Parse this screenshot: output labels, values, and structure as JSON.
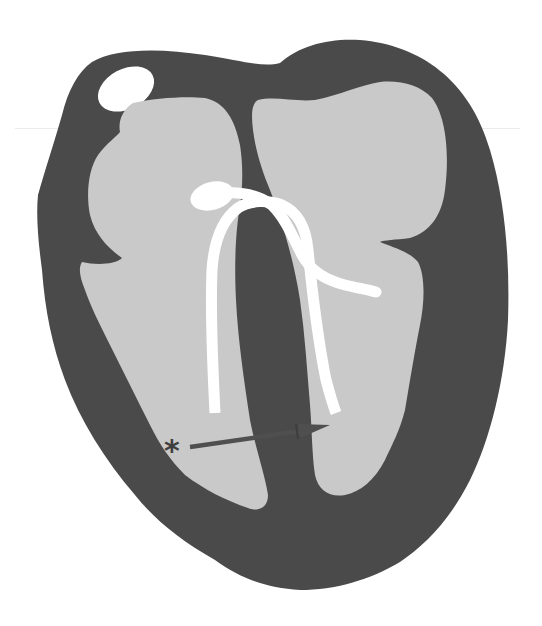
{
  "figure": {
    "annotation_marker": "*",
    "colors": {
      "background": "#ffffff",
      "myocardium": "#4a4a4a",
      "chamber": "#c9c9c9",
      "lead": "#ffffff",
      "arrow": "#4f4f4f",
      "marker": "#3e3e3e"
    },
    "elements": [
      {
        "id": "myocardium",
        "label": "heart wall"
      },
      {
        "id": "vessel",
        "label": "white oval vessel (top-left)"
      },
      {
        "id": "left-chamber",
        "label": "right-side chambers (atrium/ventricle)"
      },
      {
        "id": "right-chamber",
        "label": "left-side chambers (atrium/ventricle)"
      },
      {
        "id": "lead",
        "label": "looped white lead/catheter"
      },
      {
        "id": "arrow",
        "label": "arrow pointing across septum"
      },
      {
        "id": "asterisk",
        "label": "asterisk marker"
      }
    ]
  }
}
